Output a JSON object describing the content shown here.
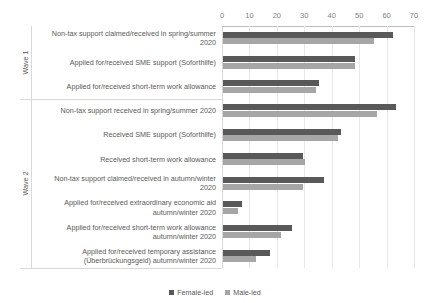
{
  "chart_data": {
    "type": "bar",
    "orientation": "horizontal",
    "title": "",
    "xlabel": "",
    "ylabel": "",
    "xlim": [
      0,
      70
    ],
    "xticks": [
      0,
      10,
      20,
      30,
      40,
      50,
      60,
      70
    ],
    "grid": true,
    "legend_position": "bottom",
    "group_axis_labels": [
      "Wave 1",
      "Wave 2"
    ],
    "groups": [
      {
        "name": "Wave 1",
        "categories": [
          "Non-tax support claimed/received in spring/summer 2020",
          "Applied for/received SME support (Soforthilfe)",
          "Applied for/received short-term work allowance"
        ]
      },
      {
        "name": "Wave 2",
        "categories": [
          "Non-tax support received in spring/summer 2020",
          "Received SME support (Soforthilfe)",
          "Received short-term work allowance",
          "Non-tax support claimed/received in autumn/winter 2020",
          "Applied for/received extraordinary economic aid autumn/winter 2020",
          "Applied for/received short-term work allowance autumn/winter 2020",
          "Applied for/received temporary assistance (Überbrückungsgeld) autumn/winter 2020"
        ]
      }
    ],
    "categories": [
      "Non-tax support claimed/received in spring/summer 2020",
      "Applied for/received SME support (Soforthilfe)",
      "Applied for/received short-term work allowance",
      "Non-tax support received in spring/summer 2020",
      "Received SME support (Soforthilfe)",
      "Received short-term work allowance",
      "Non-tax support claimed/received in autumn/winter 2020",
      "Applied for/received extraordinary economic aid autumn/winter 2020",
      "Applied for/received short-term work allowance autumn/winter 2020",
      "Applied for/received temporary assistance (Überbrückungsgeld) autumn/winter 2020"
    ],
    "series": [
      {
        "name": "Female-led",
        "color": "#595959",
        "values": [
          62,
          48,
          35,
          63,
          43,
          29,
          37,
          7,
          25,
          17
        ]
      },
      {
        "name": "Male-led",
        "color": "#a6a6a6",
        "values": [
          55,
          48,
          34,
          56,
          42,
          30,
          29,
          5.5,
          21,
          12
        ]
      }
    ]
  },
  "axis": {
    "tick_labels": [
      "0",
      "10",
      "20",
      "30",
      "40",
      "50",
      "60",
      "70"
    ]
  },
  "category_labels": [
    "Non-tax support claimed/received in spring/summer\n2020",
    "Applied for/received SME support (Soforthilfe)",
    "Applied for/received short-term work allowance",
    "Non-tax support received in spring/summer 2020",
    "Received SME support (Soforthilfe)",
    "Received short-term work allowance",
    "Non-tax support claimed/received in autumn/winter\n2020",
    "Applied for/received extraordinary economic aid\nautumn/winter 2020",
    "Applied for/received short-term work allowance\nautumn/winter 2020",
    "Applied for/received temporary assistance\n(Überbrückungsgeld) autumn/winter 2020"
  ],
  "wave_labels": [
    "Wave 1",
    "Wave 2"
  ],
  "legend": {
    "items": [
      {
        "label": "Female-led",
        "color": "#595959"
      },
      {
        "label": "Male-led",
        "color": "#a6a6a6"
      }
    ]
  }
}
